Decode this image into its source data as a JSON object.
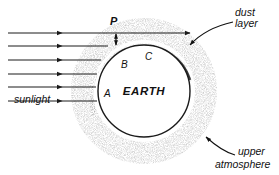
{
  "figure": {
    "background_color": "#ffffff",
    "ink_color": "#1a1a1a"
  },
  "labels": {
    "sunlight": "sunlight",
    "dust_layer_line1": "dust",
    "dust_layer_line2": "layer",
    "upper_atmosphere_line1": "upper",
    "upper_atmosphere_line2": "atmosphere",
    "earth": "EARTH",
    "point_a": "A",
    "point_b": "B",
    "point_c": "C",
    "measure_p": "P"
  },
  "diagram_data": {
    "type": "schematic",
    "earth": {
      "center_x": 144,
      "center_y": 91,
      "radius": 46,
      "fill": "#ffffff",
      "outline": "#1b1b1b"
    },
    "sun_rays": {
      "count": 6,
      "direction": "left-to-right",
      "y_positions": [
        33,
        46,
        60,
        74,
        87,
        101
      ],
      "x_start": 8,
      "arrowhead_x": 62,
      "color": "#1a1a1a"
    },
    "dust_layer": {
      "description": "dark crescent band hugging upper-left limb of Earth",
      "inner_radius": 47,
      "outer_radius": 56,
      "start_angle_deg": 112,
      "end_angle_deg": 350
    },
    "upper_atmosphere": {
      "description": "stippled halo surrounding the entire globe",
      "inner_radius": 46,
      "outer_radius": 78
    },
    "annotated_points": [
      {
        "id": "A",
        "angle_deg": 188,
        "description": "grazing point on sunlit limb"
      },
      {
        "id": "B",
        "angle_deg": 137,
        "description": "point within dust layer arc"
      },
      {
        "id": "C",
        "angle_deg": 105,
        "description": "point near top of globe"
      }
    ],
    "measure_P": {
      "description": "vertical double-headed arrow between the top two rays",
      "x": 116,
      "y_top": 33,
      "y_bottom": 46
    }
  }
}
